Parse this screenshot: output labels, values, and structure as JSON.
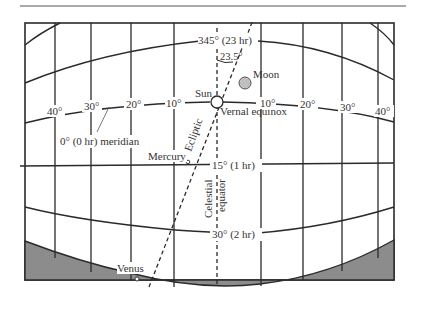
{
  "diagram": {
    "labels": {
      "top_meridian": "345° (23 hr)",
      "angle": "23.5°",
      "moon": "Moon",
      "sun": "Sun",
      "vernal_equinox": "Vernal equinox",
      "zero_meridian": "0° (0 hr) meridian",
      "ecliptic": "Ecliptic",
      "mercury": "Mercury",
      "venus": "Venus",
      "celestial": "Celestial",
      "equator": "equator",
      "meridian_15": "15° (1 hr)",
      "meridian_30": "30° (2 hr)"
    },
    "declination_ticks_left": [
      "40°",
      "30°",
      "20°",
      "10°"
    ],
    "declination_ticks_right": [
      "10°",
      "20°",
      "30°",
      "40°"
    ],
    "colors": {
      "line": "#2a2a2a",
      "horizon_fill": "#8c8c8c",
      "moon_fill": "#c0c0c0",
      "background": "#ffffff"
    }
  }
}
